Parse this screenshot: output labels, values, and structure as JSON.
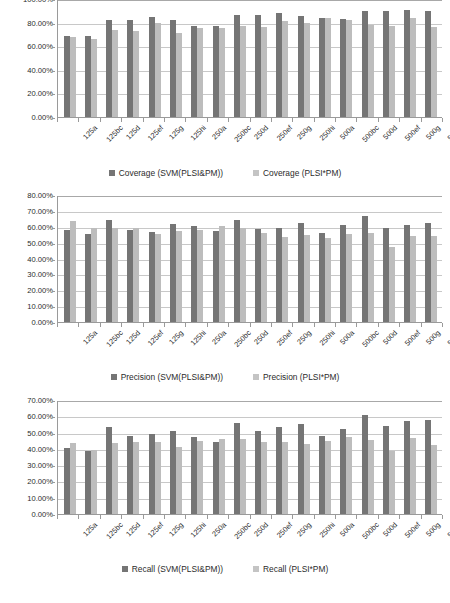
{
  "categories": [
    "125a",
    "125bc",
    "125d",
    "125ef",
    "125g",
    "125hi",
    "250a",
    "250bc",
    "250d",
    "250ef",
    "250g",
    "250hi",
    "500a",
    "500bc",
    "500d",
    "500ef",
    "500g",
    "500hi"
  ],
  "colors": {
    "series1": "#757575",
    "series2": "#bdbdbd",
    "grid": "#c8c8c8",
    "axis": "#9a9a9a"
  },
  "charts": [
    {
      "id": "coverage",
      "legend": [
        {
          "label": "Coverage (SVM(PLSI&PM))",
          "swatch": "s1"
        },
        {
          "label": "Coverage (PLSI*PM)",
          "swatch": "s2"
        }
      ],
      "yticks": [
        "0.00%",
        "20.00%",
        "40.00%",
        "60.00%",
        "80.00%",
        "100.00%"
      ],
      "chart_data": {
        "type": "bar",
        "title": "",
        "xlabel": "",
        "ylabel": "",
        "ylim": [
          0,
          100
        ],
        "grid": true,
        "legend_position": "bottom",
        "categories": [
          "125a",
          "125bc",
          "125d",
          "125ef",
          "125g",
          "125hi",
          "250a",
          "250bc",
          "250d",
          "250ef",
          "250g",
          "250hi",
          "500a",
          "500bc",
          "500d",
          "500ef",
          "500g",
          "500hi"
        ],
        "series": [
          {
            "name": "Coverage (SVM(PLSI&PM))",
            "values": [
              69.0,
              68.5,
              82.0,
              82.0,
              84.5,
              82.0,
              77.0,
              77.0,
              86.5,
              86.5,
              88.0,
              86.0,
              83.5,
              83.0,
              89.5,
              89.5,
              90.5,
              89.5
            ]
          },
          {
            "name": "Coverage (PLSI*PM)",
            "values": [
              67.5,
              66.5,
              73.5,
              73.0,
              80.0,
              71.0,
              75.5,
              75.5,
              77.0,
              76.5,
              81.5,
              79.5,
              83.5,
              82.5,
              78.0,
              77.5,
              83.5,
              76.5
            ]
          }
        ]
      }
    },
    {
      "id": "precision",
      "legend": [
        {
          "label": "Precision (SVM(PLSI&PM))",
          "swatch": "s1"
        },
        {
          "label": "Precision (PLSI*PM)",
          "swatch": "s2"
        }
      ],
      "yticks": [
        "0.00%",
        "10.00%",
        "20.00%",
        "30.00%",
        "40.00%",
        "50.00%",
        "60.00%",
        "70.00%",
        "80.00%"
      ],
      "chart_data": {
        "type": "bar",
        "title": "",
        "xlabel": "",
        "ylabel": "",
        "ylim": [
          0,
          80
        ],
        "grid": true,
        "legend_position": "bottom",
        "categories": [
          "125a",
          "125bc",
          "125d",
          "125ef",
          "125g",
          "125hi",
          "250a",
          "250bc",
          "250d",
          "250ef",
          "250g",
          "250hi",
          "500a",
          "500bc",
          "500d",
          "500ef",
          "500g",
          "500hi"
        ],
        "series": [
          {
            "name": "Precision (SVM(PLSI&PM))",
            "values": [
              58.0,
              55.5,
              64.5,
              58.0,
              56.5,
              61.5,
              60.5,
              57.5,
              64.0,
              58.5,
              59.5,
              62.5,
              56.0,
              61.0,
              66.5,
              59.0,
              61.0,
              62.5
            ]
          },
          {
            "name": "Precision (PLSI*PM)",
            "values": [
              63.5,
              59.0,
              59.5,
              59.5,
              55.5,
              57.5,
              58.0,
              60.5,
              59.5,
              56.0,
              53.5,
              54.5,
              53.0,
              55.5,
              56.0,
              47.5,
              54.0,
              54.0
            ]
          }
        ]
      }
    },
    {
      "id": "recall",
      "legend": [
        {
          "label": "Recall (SVM(PLSI&PM))",
          "swatch": "s1"
        },
        {
          "label": "Recall (PLSI*PM)",
          "swatch": "s2"
        }
      ],
      "yticks": [
        "0.00%",
        "10.00%",
        "20.00%",
        "30.00%",
        "40.00%",
        "50.00%",
        "60.00%",
        "70.00%"
      ],
      "chart_data": {
        "type": "bar",
        "title": "",
        "xlabel": "",
        "ylabel": "",
        "ylim": [
          0,
          70
        ],
        "grid": true,
        "legend_position": "bottom",
        "categories": [
          "125a",
          "125bc",
          "125d",
          "125ef",
          "125g",
          "125hi",
          "250a",
          "250bc",
          "250d",
          "250ef",
          "250g",
          "250hi",
          "500a",
          "500bc",
          "500d",
          "500ef",
          "500g",
          "500hi"
        ],
        "series": [
          {
            "name": "Recall (SVM(PLSI&PM))",
            "values": [
              40.5,
              38.5,
              53.5,
              48.0,
              49.0,
              51.0,
              47.5,
              44.5,
              56.0,
              51.0,
              53.5,
              55.0,
              48.0,
              52.0,
              61.0,
              54.0,
              57.0,
              57.5
            ]
          },
          {
            "name": "Recall (PLSI*PM)",
            "values": [
              43.5,
              39.5,
              43.5,
              44.0,
              44.5,
              41.0,
              45.0,
              46.0,
              46.0,
              44.0,
              44.5,
              43.0,
              45.0,
              47.0,
              45.5,
              39.0,
              46.5,
              42.5
            ]
          }
        ]
      }
    }
  ]
}
